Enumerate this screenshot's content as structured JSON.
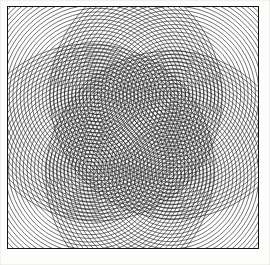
{
  "figure": {
    "kind": "line-art-diagram",
    "background_color": "#fdfdfc",
    "ink_color": "#1a1a1a",
    "frame": {
      "visible": true,
      "color": "#141414",
      "stroke_width": 1.3,
      "x": 7,
      "y": 6,
      "width": 252,
      "height": 243
    },
    "canvas": {
      "width": 270,
      "height": 265
    }
  },
  "chart_data": {
    "type": "scatter",
    "xlabel": "",
    "ylabel": "",
    "xlim": [
      0,
      252
    ],
    "ylim": [
      0,
      243
    ],
    "grid": false,
    "legend": "none",
    "annotations": [],
    "pattern": {
      "element": "concentric-circles",
      "family_count": 4,
      "ring_spacing_px": 3.7,
      "rings_per_family": 34,
      "stroke_width": 0.62,
      "stroke_color": "#1a1a1a"
    },
    "series": [
      {
        "name": "center-top-left",
        "cx": 90,
        "cy": 90,
        "rings": 34,
        "spacing": 3.7,
        "max_radius": 126,
        "values": [
          3.7,
          7.4,
          11.1,
          14.8,
          18.5,
          22.2,
          25.9,
          29.6,
          33.3,
          37,
          40.7,
          44.4,
          48.1,
          51.8,
          55.5,
          59.2,
          62.9,
          66.6,
          70.3,
          74,
          77.7,
          81.4,
          85.1,
          88.8,
          92.5,
          96.2,
          99.9,
          103.6,
          107.3,
          111,
          114.7,
          118.4,
          122.1,
          125.8
        ]
      },
      {
        "name": "center-top-right",
        "cx": 168,
        "cy": 88,
        "rings": 34,
        "spacing": 3.7,
        "max_radius": 126,
        "values": [
          3.7,
          7.4,
          11.1,
          14.8,
          18.5,
          22.2,
          25.9,
          29.6,
          33.3,
          37,
          40.7,
          44.4,
          48.1,
          51.8,
          55.5,
          59.2,
          62.9,
          66.6,
          70.3,
          74,
          77.7,
          81.4,
          85.1,
          88.8,
          92.5,
          96.2,
          99.9,
          103.6,
          107.3,
          111,
          114.7,
          118.4,
          122.1,
          125.8
        ]
      },
      {
        "name": "center-bottom-left",
        "cx": 82,
        "cy": 163,
        "rings": 34,
        "spacing": 3.7,
        "max_radius": 126,
        "values": [
          3.7,
          7.4,
          11.1,
          14.8,
          18.5,
          22.2,
          25.9,
          29.6,
          33.3,
          37,
          40.7,
          44.4,
          48.1,
          51.8,
          55.5,
          59.2,
          62.9,
          66.6,
          70.3,
          74,
          77.7,
          81.4,
          85.1,
          88.8,
          92.5,
          96.2,
          99.9,
          103.6,
          107.3,
          111,
          114.7,
          118.4,
          122.1,
          125.8
        ]
      },
      {
        "name": "center-bottom-right",
        "cx": 164,
        "cy": 170,
        "rings": 34,
        "spacing": 3.7,
        "max_radius": 126,
        "values": [
          3.7,
          7.4,
          11.1,
          14.8,
          18.5,
          22.2,
          25.9,
          29.6,
          33.3,
          37,
          40.7,
          44.4,
          48.1,
          51.8,
          55.5,
          59.2,
          62.9,
          66.6,
          70.3,
          74,
          77.7,
          81.4,
          85.1,
          88.8,
          92.5,
          96.2,
          99.9,
          103.6,
          107.3,
          111,
          114.7,
          118.4,
          122.1,
          125.8
        ]
      }
    ]
  }
}
